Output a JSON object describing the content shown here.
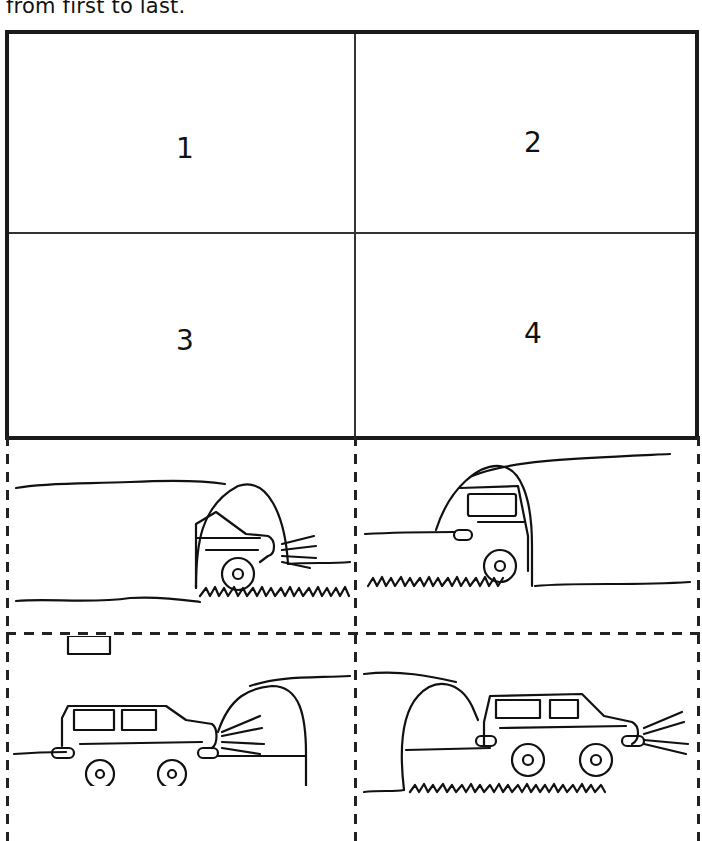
{
  "instruction": "from first to last.",
  "sequence_boxes": [
    {
      "label": "1"
    },
    {
      "label": "2"
    },
    {
      "label": "3"
    },
    {
      "label": "4"
    }
  ],
  "cut_out_pictures": [
    {
      "description": "car front emerging from tunnel with headlights"
    },
    {
      "description": "car rear entering tunnel"
    },
    {
      "description": "car approaching tunnel from left, headlights on"
    },
    {
      "description": "car exiting tunnel, driving right with headlights"
    }
  ]
}
